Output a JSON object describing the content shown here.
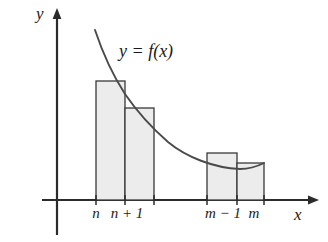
{
  "figure": {
    "background_color": "#ffffff",
    "axes": {
      "y_axis_label": "y",
      "x_axis_label": "x",
      "axis_color": "#2b2b2b",
      "origin_x": 57,
      "origin_y": 200
    },
    "curve": {
      "label": "y = f(x)",
      "color": "#4a4a4a",
      "description": "decreasing convex curve",
      "start": [
        95,
        30
      ],
      "end": [
        264,
        163
      ]
    },
    "ticks": [
      {
        "name": "n",
        "text": "n",
        "x": 96
      },
      {
        "name": "n+1",
        "text": "n + 1",
        "x": 127
      },
      {
        "name": "m-1",
        "text": "m − 1",
        "x": 223
      },
      {
        "name": "m",
        "text": "m",
        "x": 254
      }
    ],
    "bars": {
      "fill_color": "#ececec",
      "stroke_color": "#3a3a3a",
      "items": [
        {
          "name": "bar-n",
          "x0": 96,
          "x1": 125,
          "top": 81,
          "baseline": 200
        },
        {
          "name": "bar-n-1",
          "x0": 125,
          "x1": 154,
          "top": 108,
          "baseline": 200
        },
        {
          "name": "bar-m-2",
          "x0": 207,
          "x1": 237,
          "top": 153,
          "baseline": 200
        },
        {
          "name": "bar-m-1",
          "x0": 237,
          "x1": 264,
          "top": 163,
          "baseline": 200
        }
      ]
    }
  }
}
